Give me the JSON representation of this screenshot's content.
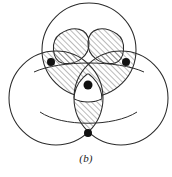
{
  "figure": {
    "caption": "(b)",
    "background_color": "#ffffff",
    "stroke_color": "#2b2b2b",
    "hatch_color": "#3a3a3a",
    "dot_color": "#111111",
    "canvas": {
      "width": 172,
      "height": 177
    }
  },
  "geometry": {
    "circles": [
      {
        "label": "top-circle",
        "cx": 89,
        "cy": 50,
        "r": 47
      },
      {
        "label": "left-circle",
        "cx": 56,
        "cy": 98,
        "r": 47
      },
      {
        "label": "right-circle",
        "cx": 121,
        "cy": 98,
        "r": 47
      }
    ],
    "points": [
      {
        "label": "left-center-dot",
        "cx": 51,
        "cy": 62,
        "r": 4
      },
      {
        "label": "right-center-dot",
        "cx": 126,
        "cy": 62,
        "r": 4
      },
      {
        "label": "bottom-center-dot",
        "cx": 88,
        "cy": 133,
        "r": 4
      },
      {
        "label": "centroid-dot",
        "cx": 88,
        "cy": 85,
        "r": 4.5
      }
    ],
    "inner_region": {
      "label": "reuleaux-core",
      "cx": 88,
      "cy": 88,
      "r": 31
    },
    "lobes": [
      {
        "label": "upper-left-lobe"
      },
      {
        "label": "upper-right-lobe"
      }
    ],
    "hatching": {
      "angle_degrees": 45,
      "spacing_px": 4,
      "line_width_px": 0.7
    }
  }
}
